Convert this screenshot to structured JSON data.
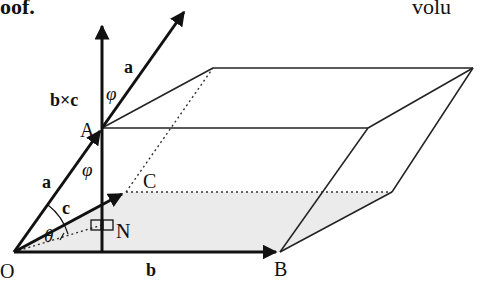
{
  "snippets": {
    "top_left": "oof.",
    "top_right": "volu"
  },
  "diagram": {
    "points": {
      "O": {
        "label": "O",
        "x": 14,
        "y": 252
      },
      "A": {
        "label": "A",
        "x": 102,
        "y": 128
      },
      "B": {
        "label": "B",
        "x": 280,
        "y": 252
      },
      "C": {
        "label": "C",
        "x": 126,
        "y": 192
      },
      "N": {
        "label": "N",
        "x": 102,
        "y": 225
      }
    },
    "vectors": {
      "a_lower": "a",
      "a_upper": "a",
      "b": "b",
      "c": "c",
      "bxc": "b×c"
    },
    "angles": {
      "phi_upper": "φ",
      "phi_lower": "φ",
      "theta": "θ"
    },
    "colors": {
      "stroke": "#111111",
      "base_shade": "#ebebeb",
      "background": "#ffffff"
    }
  }
}
